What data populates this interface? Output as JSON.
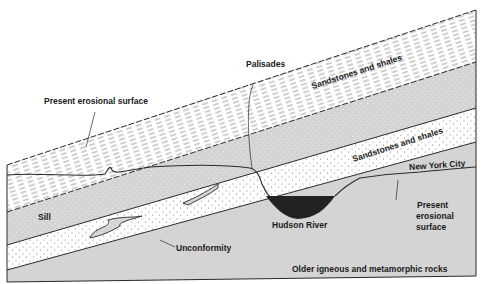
{
  "diagram": {
    "layers": [
      {
        "id": "upper-shales",
        "label": "Sandstones and shales",
        "pattern": "dashed-lines"
      },
      {
        "id": "sill",
        "label": "Sill",
        "pattern": "gray-dotted"
      },
      {
        "id": "lower-sandstones",
        "label": "Sandstones and shales",
        "pattern": "white-dotted"
      },
      {
        "id": "basement",
        "label": "Older igneous and metamorphic rocks",
        "pattern": "gray"
      }
    ],
    "annotations": {
      "present_erosional_surface_left": "Present erosional surface",
      "palisades": "Palisades",
      "upper_sandstones": "Sandstones and shales",
      "lower_sandstones": "Sandstones and shales",
      "new_york_city": "New York City",
      "sill": "Sill",
      "hudson_river": "Hudson River",
      "present_erosional_surface_right_1": "Present",
      "present_erosional_surface_right_2": "erosional",
      "present_erosional_surface_right_3": "surface",
      "unconformity": "Unconformity",
      "older_rocks": "Older igneous and metamorphic rocks"
    },
    "colors": {
      "gray_fill": "#d4d4d4",
      "white_fill": "#ffffff",
      "line": "#2a2a2a",
      "river": "#222222"
    }
  }
}
